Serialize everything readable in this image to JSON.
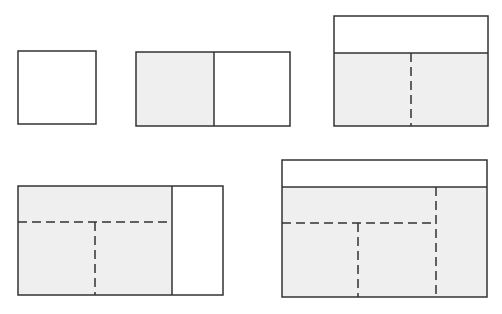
{
  "colors": {
    "background": "#ffffff",
    "stroke": "#333333",
    "shaded_fill": "#efefef",
    "unshaded_fill": "#ffffff"
  },
  "figure": {
    "shapes": [
      {
        "id": "step-1",
        "kind": "square",
        "outer": [
          18,
          51,
          78,
          73
        ],
        "regions": [
          {
            "shaded": false,
            "rect": [
              18,
              51,
              78,
              73
            ]
          }
        ],
        "solid_lines": [],
        "dashed_lines": []
      },
      {
        "id": "step-2",
        "kind": "rectangle split in two",
        "outer": [
          136,
          52,
          154,
          74
        ],
        "regions": [
          {
            "shaded": true,
            "rect": [
              136,
              52,
              78,
              74
            ]
          },
          {
            "shaded": false,
            "rect": [
              214,
              52,
              76,
              74
            ]
          }
        ],
        "solid_lines": [
          [
            214,
            52,
            214,
            126
          ]
        ],
        "dashed_lines": []
      },
      {
        "id": "step-3",
        "kind": "rectangle with top band and dashed vertical split",
        "outer": [
          334,
          16,
          154,
          110
        ],
        "regions": [
          {
            "shaded": false,
            "rect": [
              334,
              16,
              154,
              37
            ]
          },
          {
            "shaded": true,
            "rect": [
              334,
              53,
              154,
              73
            ]
          }
        ],
        "solid_lines": [
          [
            334,
            53,
            488,
            53
          ]
        ],
        "dashed_lines": [
          [
            411,
            53,
            411,
            126
          ]
        ]
      },
      {
        "id": "step-4",
        "kind": "rectangle with right band and dashed T split",
        "outer": [
          18,
          186,
          205,
          109
        ],
        "regions": [
          {
            "shaded": true,
            "rect": [
              18,
              186,
              154,
              109
            ]
          },
          {
            "shaded": false,
            "rect": [
              172,
              186,
              51,
              109
            ]
          }
        ],
        "solid_lines": [
          [
            172,
            186,
            172,
            295
          ]
        ],
        "dashed_lines": [
          [
            18,
            222,
            172,
            222
          ],
          [
            95,
            222,
            95,
            295
          ]
        ]
      },
      {
        "id": "step-5",
        "kind": "rectangle with top band and nested dashed splits",
        "outer": [
          282,
          160,
          205,
          137
        ],
        "regions": [
          {
            "shaded": false,
            "rect": [
              282,
              160,
              205,
              27
            ]
          },
          {
            "shaded": true,
            "rect": [
              282,
              187,
              205,
              110
            ]
          }
        ],
        "solid_lines": [
          [
            282,
            187,
            487,
            187
          ]
        ],
        "dashed_lines": [
          [
            436,
            187,
            436,
            297
          ],
          [
            282,
            223,
            436,
            223
          ],
          [
            358,
            223,
            358,
            297
          ]
        ]
      }
    ]
  }
}
